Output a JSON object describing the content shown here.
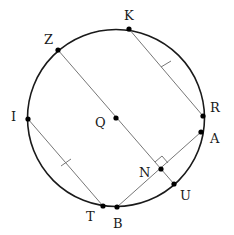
{
  "diagram": {
    "type": "circle-geometry",
    "circle": {
      "center": "Q",
      "cx": 116,
      "cy": 118,
      "r": 88
    },
    "points": {
      "Z": {
        "label": "Z",
        "x": 58,
        "y": 50,
        "lx": 44,
        "ly": 44
      },
      "K": {
        "label": "K",
        "x": 129,
        "y": 29,
        "lx": 124,
        "ly": 20
      },
      "R": {
        "label": "R",
        "x": 203,
        "y": 116,
        "lx": 210,
        "ly": 112
      },
      "A": {
        "label": "A",
        "x": 201,
        "y": 132,
        "lx": 210,
        "ly": 143
      },
      "U": {
        "label": "U",
        "x": 174,
        "y": 184,
        "lx": 180,
        "ly": 200
      },
      "B": {
        "label": "B",
        "x": 117,
        "y": 207,
        "lx": 115,
        "ly": 228
      },
      "T": {
        "label": "T",
        "x": 103,
        "y": 206,
        "lx": 86,
        "ly": 221
      },
      "I": {
        "label": "I",
        "x": 28,
        "y": 119,
        "lx": 11,
        "ly": 121
      },
      "Q": {
        "label": "Q",
        "x": 116,
        "y": 118,
        "lx": 95,
        "ly": 127
      },
      "N": {
        "label": "N",
        "x": 161,
        "y": 169,
        "lx": 139,
        "ly": 177
      }
    },
    "segments": [
      {
        "from": "Z",
        "to": "U",
        "name": "diameter-line-ZU"
      },
      {
        "from": "K",
        "to": "R",
        "name": "chord-KR",
        "tick": true
      },
      {
        "from": "I",
        "to": "T",
        "name": "chord-IT",
        "tick": true
      },
      {
        "from": "B",
        "to": "A",
        "name": "chord-BA"
      }
    ],
    "right_angle_at": "N",
    "colors": {
      "circle": "#1a1a1a",
      "segment": "#777777",
      "point": "#000000"
    }
  }
}
